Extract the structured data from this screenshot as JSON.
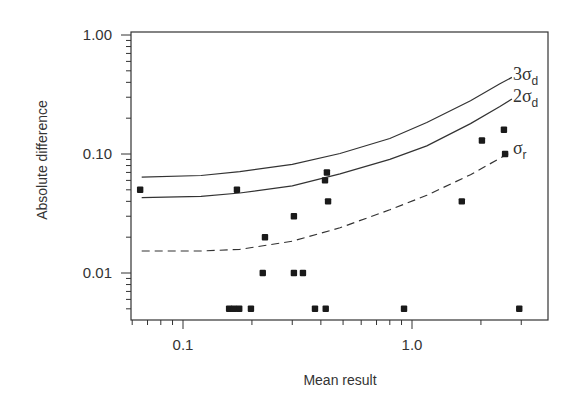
{
  "chart_data": {
    "type": "scatter",
    "title": "",
    "xlabel": "Mean result",
    "ylabel": "Absolute difference",
    "xscale": "log",
    "yscale": "log",
    "xlim": [
      0.059,
      3.9
    ],
    "ylim": [
      0.004,
      1.0
    ],
    "grid": false,
    "legend": "none",
    "x_ticks": [
      {
        "value": 0.1,
        "label": "0.1"
      },
      {
        "value": 1.0,
        "label": "1.0"
      }
    ],
    "y_ticks": [
      {
        "value": 1.0,
        "label": "1.00"
      },
      {
        "value": 0.1,
        "label": "0.10"
      },
      {
        "value": 0.01,
        "label": "0.01"
      }
    ],
    "series": [
      {
        "name": "data points",
        "kind": "scatter",
        "marker": "square",
        "points": [
          [
            0.065,
            0.05
          ],
          [
            0.172,
            0.05
          ],
          [
            0.228,
            0.02
          ],
          [
            0.305,
            0.03
          ],
          [
            0.425,
            0.07
          ],
          [
            0.417,
            0.06
          ],
          [
            0.43,
            0.04
          ],
          [
            0.223,
            0.01
          ],
          [
            0.305,
            0.01
          ],
          [
            0.334,
            0.01
          ],
          [
            0.159,
            0.005
          ],
          [
            0.167,
            0.005
          ],
          [
            0.176,
            0.005
          ],
          [
            0.198,
            0.005
          ],
          [
            0.377,
            0.005
          ],
          [
            0.42,
            0.005
          ],
          [
            0.923,
            0.005
          ],
          [
            2.94,
            0.005
          ],
          [
            1.65,
            0.04
          ],
          [
            2.02,
            0.13
          ],
          [
            2.52,
            0.16
          ],
          [
            2.55,
            0.1
          ]
        ]
      },
      {
        "name": "3σd",
        "label_main": "3σ",
        "label_sub": "d",
        "kind": "line",
        "style": "solid",
        "points": [
          [
            0.066,
            0.064
          ],
          [
            0.12,
            0.066
          ],
          [
            0.177,
            0.071
          ],
          [
            0.3,
            0.082
          ],
          [
            0.485,
            0.101
          ],
          [
            0.8,
            0.135
          ],
          [
            1.16,
            0.184
          ],
          [
            1.8,
            0.28
          ],
          [
            2.42,
            0.39
          ],
          [
            2.73,
            0.44
          ]
        ]
      },
      {
        "name": "2σd",
        "label_main": "2σ",
        "label_sub": "d",
        "kind": "line",
        "style": "solid",
        "points": [
          [
            0.066,
            0.043
          ],
          [
            0.12,
            0.044
          ],
          [
            0.177,
            0.047
          ],
          [
            0.3,
            0.054
          ],
          [
            0.485,
            0.068
          ],
          [
            0.8,
            0.09
          ],
          [
            1.16,
            0.117
          ],
          [
            1.8,
            0.18
          ],
          [
            2.42,
            0.25
          ],
          [
            2.73,
            0.29
          ]
        ]
      },
      {
        "name": "σr",
        "label_main": "σ",
        "label_sub": "r",
        "kind": "line",
        "style": "dashed",
        "points": [
          [
            0.066,
            0.0153
          ],
          [
            0.12,
            0.0153
          ],
          [
            0.177,
            0.0158
          ],
          [
            0.3,
            0.0185
          ],
          [
            0.485,
            0.024
          ],
          [
            0.8,
            0.034
          ],
          [
            1.16,
            0.045
          ],
          [
            1.8,
            0.067
          ],
          [
            2.42,
            0.092
          ],
          [
            2.73,
            0.105
          ]
        ]
      }
    ]
  }
}
